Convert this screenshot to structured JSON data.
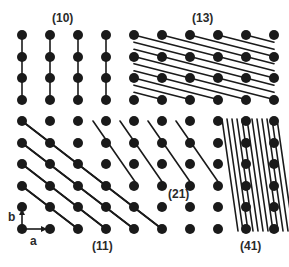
{
  "labels": {
    "p10": "(10)",
    "p13": "(13)",
    "p11": "(11)",
    "p21": "(21)",
    "p41": "(41)",
    "axis_a": "a",
    "axis_b": "b"
  },
  "lattice": {
    "columns_x": [
      22,
      50,
      78,
      106,
      134,
      162,
      190,
      218,
      246,
      274
    ],
    "top_rows_y": [
      35,
      57,
      78,
      100
    ],
    "bottom_rows_y": [
      121,
      143,
      164,
      186,
      207,
      229
    ],
    "dot_radius": 5,
    "dot_color": "#1a1a1a",
    "line_color": "#1a1a1a"
  },
  "panels": [
    {
      "name": "(10)",
      "region": "top-left",
      "line_direction": "vertical"
    },
    {
      "name": "(13)",
      "region": "top-right",
      "line_direction": "shallow diagonal"
    },
    {
      "name": "(11)",
      "region": "bottom-left",
      "line_direction": "diagonal"
    },
    {
      "name": "(21)",
      "region": "bottom-middle",
      "line_direction": "steep diagonal"
    },
    {
      "name": "(41)",
      "region": "bottom-right",
      "line_direction": "very steep diagonal"
    }
  ]
}
